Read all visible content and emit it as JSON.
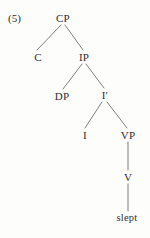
{
  "figure": {
    "example_number": "(5)",
    "type": "syntax-tree",
    "ink_color": "#2e2e2e",
    "line_color": "#6f6f6f",
    "background_color": "#fdfdfc"
  },
  "nodes": [
    {
      "id": "cp",
      "label": "CP",
      "x": 63,
      "y": 18
    },
    {
      "id": "c",
      "label": "C",
      "x": 38,
      "y": 57
    },
    {
      "id": "ip",
      "label": "IP",
      "x": 84,
      "y": 57
    },
    {
      "id": "dp",
      "label": "DP",
      "x": 62,
      "y": 96
    },
    {
      "id": "ibar",
      "label": "I′",
      "x": 105,
      "y": 95
    },
    {
      "id": "i",
      "label": "I",
      "x": 85,
      "y": 135
    },
    {
      "id": "vp",
      "label": "VP",
      "x": 128,
      "y": 135
    },
    {
      "id": "v",
      "label": "V",
      "x": 128,
      "y": 177
    },
    {
      "id": "slept",
      "label": "slept",
      "x": 127,
      "y": 218
    }
  ],
  "edges": [
    {
      "id": "cp-c",
      "from": "CP",
      "to": "C",
      "x1": 61,
      "y1": 25,
      "x2": 37,
      "y2": 50
    },
    {
      "id": "cp-ip",
      "from": "CP",
      "to": "IP",
      "x1": 65,
      "y1": 25,
      "x2": 83,
      "y2": 50
    },
    {
      "id": "ip-dp",
      "from": "IP",
      "to": "DP",
      "x1": 82,
      "y1": 64,
      "x2": 63,
      "y2": 89
    },
    {
      "id": "ip-ibar",
      "from": "IP",
      "to": "I′",
      "x1": 86,
      "y1": 64,
      "x2": 104,
      "y2": 88
    },
    {
      "id": "ibar-i",
      "from": "I′",
      "to": "I",
      "x1": 102,
      "y1": 102,
      "x2": 85,
      "y2": 128
    },
    {
      "id": "ibar-vp",
      "from": "I′",
      "to": "VP",
      "x1": 107,
      "y1": 102,
      "x2": 127,
      "y2": 128
    },
    {
      "id": "vp-v",
      "from": "VP",
      "to": "V",
      "x1": 128,
      "y1": 142,
      "x2": 128,
      "y2": 170
    },
    {
      "id": "v-slept",
      "from": "V",
      "to": "slept",
      "x1": 128,
      "y1": 184,
      "x2": 128,
      "y2": 211
    }
  ]
}
